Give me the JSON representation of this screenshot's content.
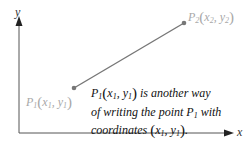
{
  "axes": {
    "x_label": "x",
    "y_label": "y",
    "color": "#555555"
  },
  "points": {
    "p1": {
      "name": "P",
      "sub": "1",
      "x_name": "x",
      "x_sub": "1",
      "y_name": "y",
      "y_sub": "1"
    },
    "p2": {
      "name": "P",
      "sub": "2",
      "x_name": "x",
      "x_sub": "2",
      "y_name": "y",
      "y_sub": "2"
    }
  },
  "segment": {
    "color": "#777777",
    "label_color": "#a8a8a8"
  },
  "annotation": {
    "line1_after": " is another way",
    "line2": "of writing the point ",
    "line2_after": " with",
    "line3": "coordinates ",
    "line3_end": "."
  },
  "symbols": {
    "P": "P",
    "one": "1",
    "x": "x",
    "y": "y",
    "comma": ", ",
    "open": "(",
    "close": ")"
  }
}
